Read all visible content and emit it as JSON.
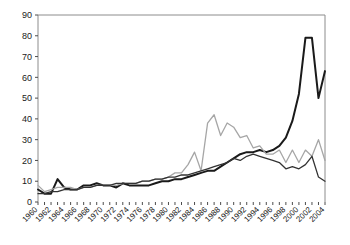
{
  "chart_data": {
    "type": "line",
    "title": "",
    "subtitle": "",
    "xlabel": "",
    "ylabel": "",
    "xlim": [
      1960,
      2004
    ],
    "ylim": [
      0,
      90
    ],
    "y_ticks": [
      0,
      10,
      20,
      30,
      40,
      50,
      60,
      70,
      80,
      90
    ],
    "x_ticks_labeled": [
      1960,
      1962,
      1964,
      1966,
      1968,
      1970,
      1972,
      1974,
      1976,
      1978,
      1980,
      1982,
      1984,
      1986,
      1988,
      1990,
      1992,
      1994,
      1996,
      1998,
      2000,
      2002,
      2004
    ],
    "x_tick_label_rotation": -45,
    "grid": false,
    "legend": null,
    "legend_position": "none",
    "x": [
      1960,
      1961,
      1962,
      1963,
      1964,
      1965,
      1966,
      1967,
      1968,
      1969,
      1970,
      1971,
      1972,
      1973,
      1974,
      1975,
      1976,
      1977,
      1978,
      1979,
      1980,
      1981,
      1982,
      1983,
      1984,
      1985,
      1986,
      1987,
      1988,
      1989,
      1990,
      1991,
      1992,
      1993,
      1994,
      1995,
      1996,
      1997,
      1998,
      1999,
      2000,
      2001,
      2002,
      2003,
      2004
    ],
    "series": [
      {
        "name": "series-thick-black",
        "color": "#1a1a1a",
        "width": 2.0,
        "values": [
          6,
          4,
          4,
          11,
          7,
          6,
          6,
          8,
          8,
          9,
          8,
          8,
          7,
          9,
          8,
          8,
          8,
          8,
          9,
          10,
          10,
          11,
          11,
          12,
          13,
          14,
          15,
          15,
          17,
          19,
          21,
          23,
          24,
          24,
          25,
          24,
          25,
          27,
          31,
          39,
          52,
          79,
          79,
          50,
          63
        ]
      },
      {
        "name": "series-light-gray",
        "color": "#a6a6a6",
        "width": 1.3,
        "values": [
          8,
          5,
          6,
          7,
          7,
          7,
          6,
          7,
          7,
          8,
          8,
          8,
          8,
          9,
          9,
          9,
          10,
          10,
          11,
          11,
          12,
          14,
          14,
          18,
          24,
          15,
          38,
          42,
          32,
          38,
          36,
          31,
          32,
          26,
          27,
          23,
          23,
          25,
          19,
          25,
          19,
          25,
          22,
          30,
          20
        ]
      },
      {
        "name": "series-medium-black",
        "color": "#333333",
        "width": 1.3,
        "values": [
          4,
          4,
          5,
          5,
          6,
          6,
          6,
          7,
          7,
          8,
          8,
          8,
          9,
          9,
          9,
          9,
          10,
          10,
          11,
          11,
          12,
          12,
          13,
          13,
          14,
          15,
          16,
          17,
          18,
          19,
          21,
          20,
          22,
          23,
          22,
          21,
          20,
          19,
          16,
          17,
          16,
          18,
          22,
          12,
          10
        ]
      }
    ]
  }
}
